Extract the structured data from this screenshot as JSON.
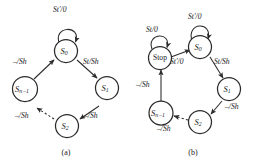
{
  "figure": {
    "background": "#ffffff",
    "ink": "#2b2b2b",
    "panels": [
      {
        "id": "a",
        "caption": "(a)",
        "nodes": [
          {
            "id": "s0",
            "label": "S",
            "sub": "0",
            "kind": "state"
          },
          {
            "id": "s1",
            "label": "S",
            "sub": "1",
            "kind": "state"
          },
          {
            "id": "s2",
            "label": "S",
            "sub": "2",
            "kind": "state"
          },
          {
            "id": "sn1",
            "label": "S",
            "sub": "n−1",
            "kind": "state"
          }
        ],
        "edges": [
          {
            "from": "s0",
            "to": "s0",
            "label": "St′/0",
            "style": "solid",
            "kind": "self-loop"
          },
          {
            "from": "s0",
            "to": "s1",
            "label": "St/Sh",
            "style": "solid",
            "kind": "transition"
          },
          {
            "from": "s1",
            "to": "s2",
            "label": "–/Sh",
            "style": "solid",
            "kind": "transition"
          },
          {
            "from": "s2",
            "to": "sn1",
            "label": "–/Sh",
            "style": "dashed",
            "kind": "transition"
          },
          {
            "from": "sn1",
            "to": "s0",
            "label": "–/Sh",
            "style": "solid",
            "kind": "transition"
          }
        ]
      },
      {
        "id": "b",
        "caption": "(b)",
        "nodes": [
          {
            "id": "stop",
            "label": "Stop",
            "sub": "",
            "kind": "state"
          },
          {
            "id": "s0",
            "label": "S",
            "sub": "0",
            "kind": "state"
          },
          {
            "id": "s1",
            "label": "S",
            "sub": "1",
            "kind": "state"
          },
          {
            "id": "s2",
            "label": "S",
            "sub": "2",
            "kind": "state"
          },
          {
            "id": "sn1",
            "label": "S",
            "sub": "n−1",
            "kind": "state"
          }
        ],
        "edges": [
          {
            "from": "stop",
            "to": "stop",
            "label": "St/0",
            "style": "solid",
            "kind": "self-loop"
          },
          {
            "from": "s0",
            "to": "s0",
            "label": "St′/0",
            "style": "solid",
            "kind": "self-loop"
          },
          {
            "from": "stop",
            "to": "s0",
            "label": "St′/0",
            "style": "solid",
            "kind": "transition"
          },
          {
            "from": "s0",
            "to": "s1",
            "label": "St/Sh",
            "style": "solid",
            "kind": "transition"
          },
          {
            "from": "s1",
            "to": "s2",
            "label": "–/Sh",
            "style": "solid",
            "kind": "transition"
          },
          {
            "from": "s2",
            "to": "sn1",
            "label": "–/Sh",
            "style": "dashed",
            "kind": "transition"
          },
          {
            "from": "sn1",
            "to": "stop",
            "label": "–/Sh",
            "style": "solid",
            "kind": "transition"
          }
        ]
      }
    ]
  }
}
